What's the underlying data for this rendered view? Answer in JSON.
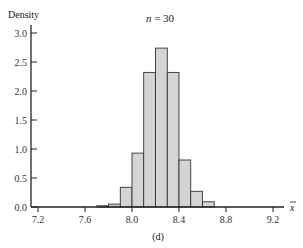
{
  "chart_data": {
    "type": "bar",
    "title": "n = 30",
    "title_italic_part": "n",
    "title_rest": " = 30",
    "xlabel": "x̄",
    "ylabel": "Density",
    "caption": "(d)",
    "xlim": [
      7.1,
      9.3
    ],
    "ylim": [
      0,
      3.2
    ],
    "x_ticks": [
      7.2,
      7.6,
      8.0,
      8.4,
      8.8,
      9.2
    ],
    "x_tick_labels": [
      "7.2",
      "7.6",
      "8.0",
      "8.4",
      "8.8",
      "9.2"
    ],
    "y_ticks": [
      0.0,
      0.5,
      1.0,
      1.5,
      2.0,
      2.5,
      3.0
    ],
    "y_tick_labels": [
      "0.0",
      "0.5",
      "1.0",
      "1.5",
      "2.0",
      "2.5",
      "3.0"
    ],
    "bin_width": 0.1,
    "bins": [
      {
        "left": 7.7,
        "right": 7.8,
        "density": 0.02
      },
      {
        "left": 7.8,
        "right": 7.9,
        "density": 0.05
      },
      {
        "left": 7.9,
        "right": 8.0,
        "density": 0.34
      },
      {
        "left": 8.0,
        "right": 8.1,
        "density": 0.93
      },
      {
        "left": 8.1,
        "right": 8.2,
        "density": 2.32
      },
      {
        "left": 8.2,
        "right": 8.3,
        "density": 2.74
      },
      {
        "left": 8.3,
        "right": 8.4,
        "density": 2.32
      },
      {
        "left": 8.4,
        "right": 8.5,
        "density": 0.81
      },
      {
        "left": 8.5,
        "right": 8.6,
        "density": 0.27
      },
      {
        "left": 8.6,
        "right": 8.7,
        "density": 0.09
      }
    ],
    "grid": false,
    "legend": null,
    "colors": {
      "bar_fill": "#d4d4d4",
      "bar_edge": "#333333",
      "axis": "#222222"
    }
  }
}
